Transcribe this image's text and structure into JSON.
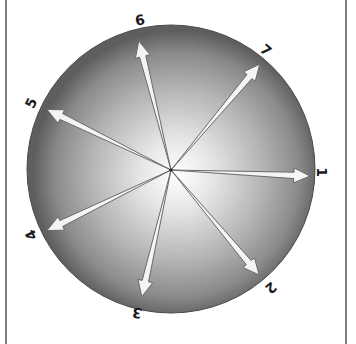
{
  "diagram": {
    "type": "radial-vector-diagram",
    "center": [
      171,
      170
    ],
    "radius": 143,
    "colors": {
      "sphere_edge": "#5a5a5a",
      "sphere_center": "#ffffff",
      "arrow_fill": "#f4f4f4",
      "arrow_stroke": "#6a6a6a",
      "border": "#555555",
      "label": "#1a1a1a"
    },
    "vectors": [
      {
        "label": "1",
        "angle_deg": 2.5,
        "length": 139,
        "label_pos": [
          322,
          172
        ],
        "label_rot": 90
      },
      {
        "label": "2",
        "angle_deg": 50,
        "length": 137,
        "label_pos": [
          271,
          288
        ],
        "label_rot": 140
      },
      {
        "label": "3",
        "angle_deg": 103,
        "length": 130,
        "label_pos": [
          137,
          313
        ],
        "label_rot": 190
      },
      {
        "label": "4",
        "angle_deg": 154,
        "length": 138,
        "label_pos": [
          31,
          235
        ],
        "label_rot": 245
      },
      {
        "label": "5",
        "angle_deg": 206,
        "length": 138,
        "label_pos": [
          31,
          103
        ],
        "label_rot": 295
      },
      {
        "label": "6",
        "angle_deg": 256,
        "length": 133,
        "label_pos": [
          140,
          20
        ],
        "label_rot": 350
      },
      {
        "label": "7",
        "angle_deg": 310,
        "length": 138,
        "label_pos": [
          266,
          50
        ],
        "label_rot": 40
      }
    ]
  }
}
